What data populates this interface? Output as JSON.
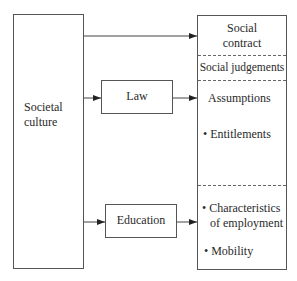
{
  "diagram": {
    "nodes": {
      "societal_culture": {
        "label_line1": "Societal",
        "label_line2": "culture"
      },
      "law": {
        "label": "Law"
      },
      "education": {
        "label": "Education"
      },
      "outcome_panel": {
        "social_contract": {
          "line1": "Social",
          "line2": "contract"
        },
        "social_judgements": "Social judgements",
        "assumptions": {
          "heading": "Assumptions",
          "bullet": "• Entitlements"
        },
        "employment": {
          "bullet1_line1": "• Characteristics",
          "bullet1_line2": "of employment",
          "bullet2": "• Mobility"
        }
      }
    },
    "edges": [
      {
        "from": "Societal culture",
        "to": "Social contract"
      },
      {
        "from": "Societal culture",
        "to": "Law"
      },
      {
        "from": "Law",
        "to": "Assumptions"
      },
      {
        "from": "Societal culture",
        "to": "Education"
      },
      {
        "from": "Education",
        "to": "Characteristics of employment"
      }
    ]
  }
}
